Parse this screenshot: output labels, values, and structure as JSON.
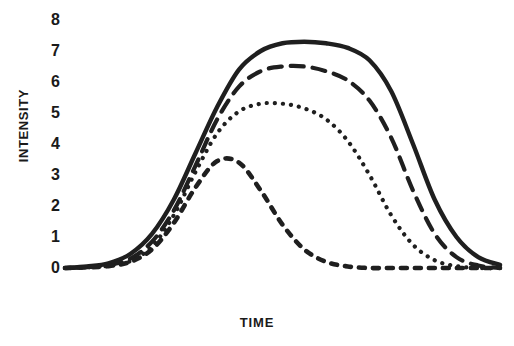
{
  "chart_data": {
    "type": "line",
    "title": "",
    "xlabel": "TIME",
    "ylabel": "INTENSITY",
    "ylim": [
      0,
      8
    ],
    "yticks": [
      8,
      7,
      6,
      5,
      4,
      3,
      2,
      1,
      0
    ],
    "ytick_labels": [
      "8",
      "7",
      "6",
      "5",
      "4",
      "3",
      "2",
      "1",
      "0"
    ],
    "xticks": [],
    "xtick_labels": [],
    "grid": false,
    "legend": null,
    "axis_color": "#1a1a1a",
    "line_color": "#1f1f1f",
    "x": [
      0,
      5,
      10,
      15,
      20,
      25,
      30,
      35,
      40,
      45,
      50,
      55,
      60,
      65,
      70,
      75,
      80,
      85,
      90,
      95,
      100
    ],
    "series": [
      {
        "name": "curve-1",
        "style": "solid",
        "peak": 7.3,
        "values": [
          0.0,
          0.05,
          0.15,
          0.45,
          1.1,
          2.2,
          3.7,
          5.2,
          6.4,
          7.0,
          7.25,
          7.3,
          7.25,
          7.1,
          6.7,
          5.7,
          4.0,
          2.2,
          1.0,
          0.35,
          0.1
        ]
      },
      {
        "name": "curve-2",
        "style": "dashed",
        "peak": 6.5,
        "values": [
          0.0,
          0.03,
          0.1,
          0.3,
          0.85,
          1.85,
          3.3,
          4.8,
          5.85,
          6.35,
          6.5,
          6.5,
          6.35,
          6.05,
          5.4,
          4.2,
          2.5,
          1.1,
          0.35,
          0.08,
          0.0
        ]
      },
      {
        "name": "curve-3",
        "style": "dotted",
        "peak": 5.3,
        "values": [
          0.0,
          0.02,
          0.07,
          0.22,
          0.7,
          1.7,
          3.1,
          4.35,
          5.05,
          5.3,
          5.3,
          5.15,
          4.8,
          4.1,
          3.0,
          1.7,
          0.75,
          0.25,
          0.06,
          0.0,
          0.0
        ]
      },
      {
        "name": "curve-4",
        "style": "short-dashed",
        "peak": 3.5,
        "values": [
          0.0,
          0.02,
          0.06,
          0.2,
          0.6,
          1.45,
          2.6,
          3.45,
          3.4,
          2.5,
          1.4,
          0.6,
          0.2,
          0.05,
          0.0,
          0.0,
          0.0,
          0.0,
          0.0,
          0.0,
          0.0
        ]
      }
    ]
  }
}
